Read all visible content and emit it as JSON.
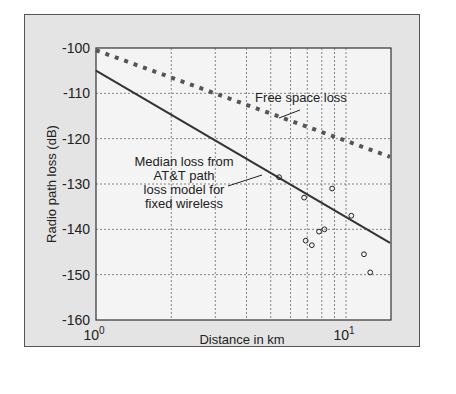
{
  "chart_data": {
    "type": "line",
    "title": "",
    "xlabel": "Distance in km",
    "ylabel": "Radio path loss (dB)",
    "xscale": "log",
    "xlim": [
      1,
      16
    ],
    "ylim": [
      -160,
      -100
    ],
    "x_ticks": [
      "10^0",
      "10^1"
    ],
    "y_ticks": [
      -100,
      -110,
      -120,
      -130,
      -140,
      -150,
      -160
    ],
    "grid": true,
    "series": [
      {
        "name": "Free space loss",
        "style": "dotted",
        "x": [
          1,
          15
        ],
        "values": [
          -100.5,
          -124
        ]
      },
      {
        "name": "Median loss from AT&T path loss model for fixed wireless",
        "style": "solid",
        "x": [
          1,
          15
        ],
        "values": [
          -105,
          -143
        ]
      },
      {
        "name": "Measured",
        "style": "scatter",
        "x": [
          5.4,
          6.8,
          6.9,
          7.3,
          7.8,
          8.2,
          8.8,
          10.5,
          11.8,
          12.5
        ],
        "values": [
          -128.5,
          -133,
          -142.5,
          -143.5,
          -140.5,
          -140,
          -131,
          -137,
          -145.5,
          -149.5
        ]
      }
    ],
    "annotations": [
      "Free space loss",
      "Median loss from",
      "AT&T path",
      "loss model for",
      "fixed wireless"
    ]
  }
}
